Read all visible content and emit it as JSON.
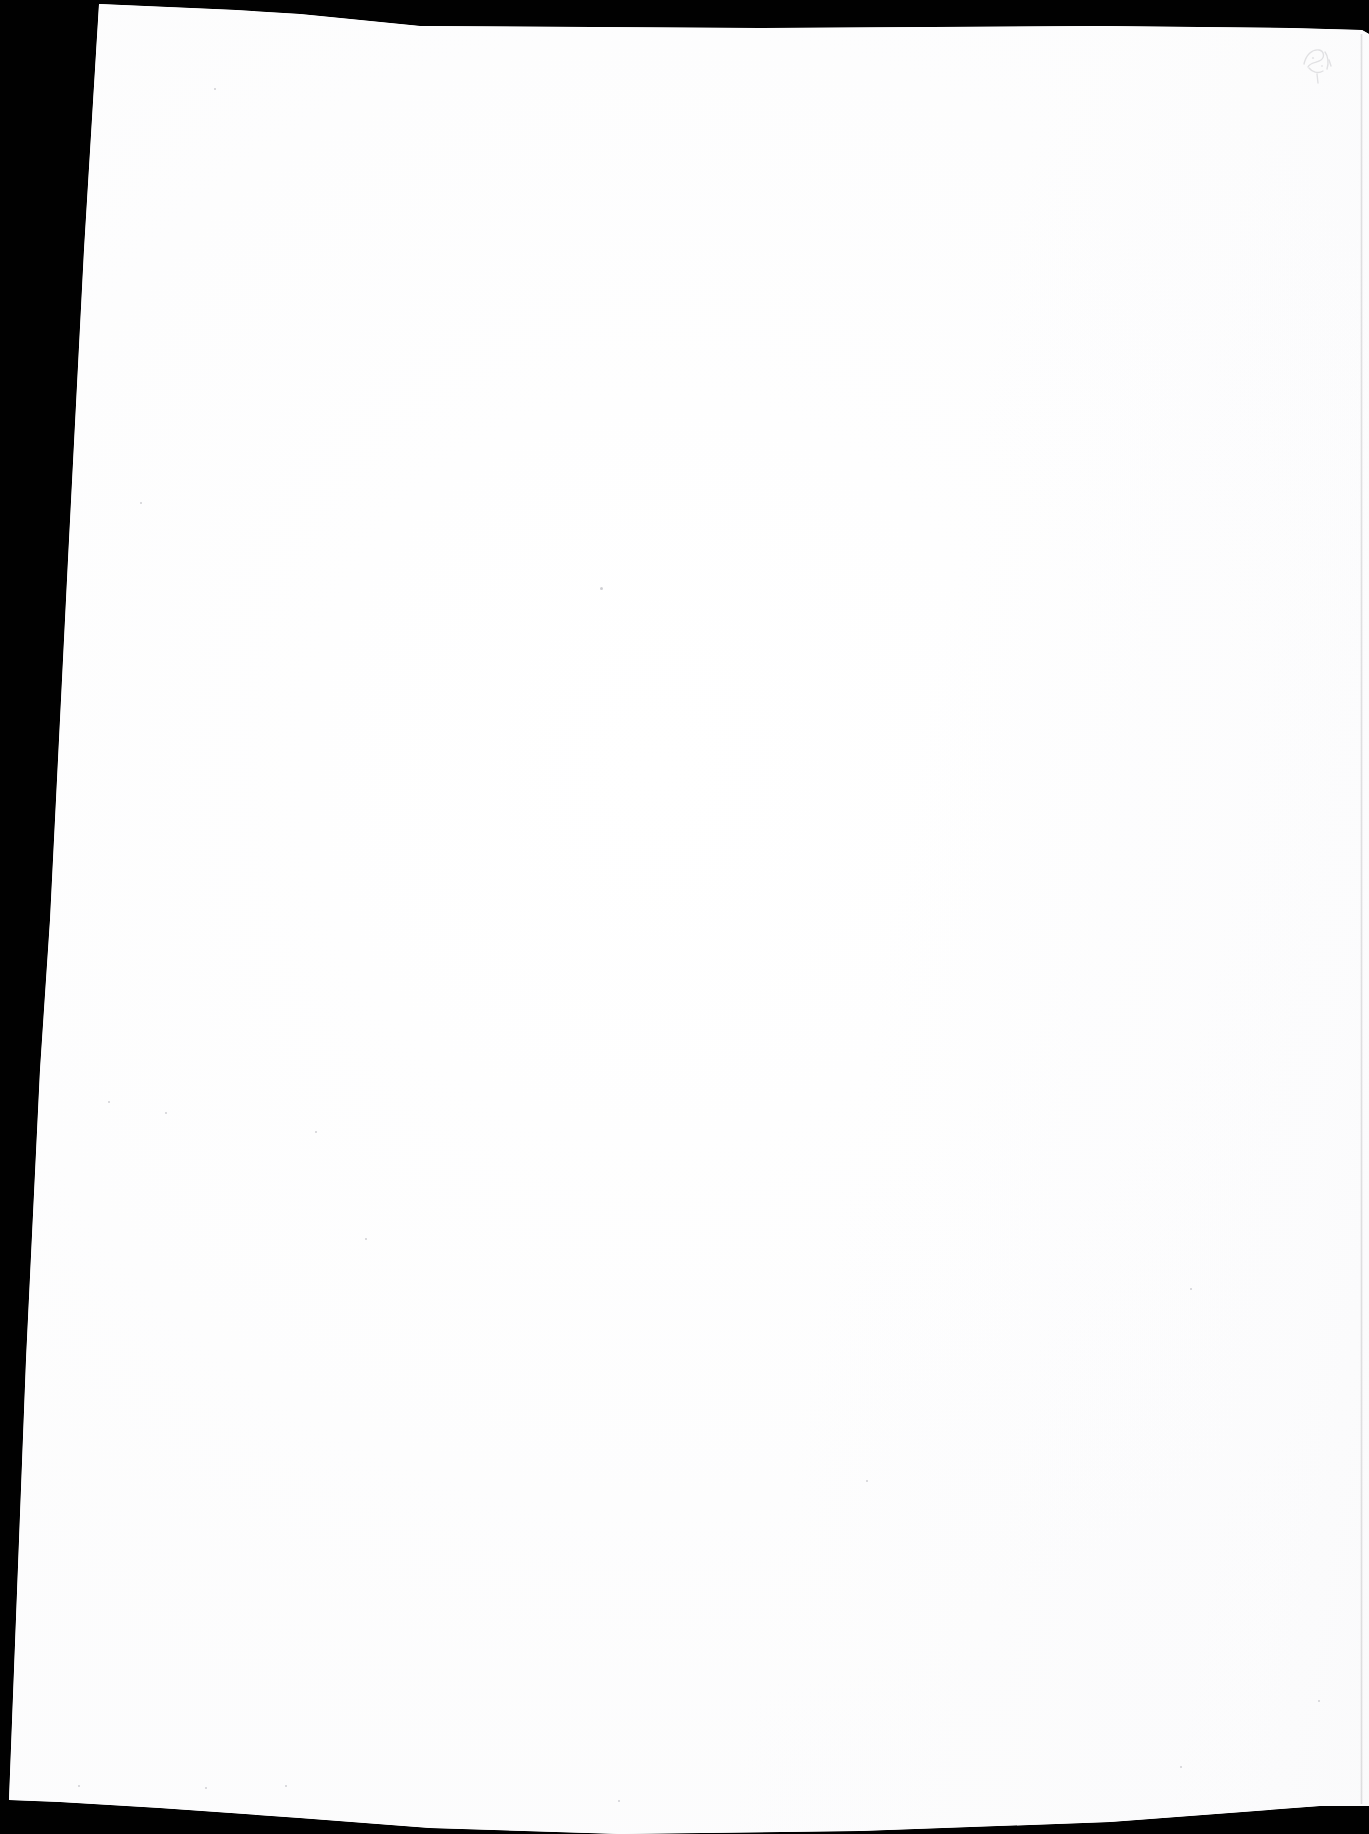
{
  "document": {
    "kind": "scanned-page",
    "page_content": "",
    "page_state_label": "Blank page",
    "orientation": "portrait"
  },
  "canvas": {
    "width": 1369,
    "height": 1834
  },
  "colors": {
    "scanner_background": "#010101",
    "paper": "#ffffff",
    "paper_shade": "#fbfbfc",
    "edge_shadow": "#78787d",
    "speck": "#cfcfd3",
    "ghost_mark": "#b9b9be"
  },
  "paper": {
    "corners": {
      "top_left": [
        99,
        4
      ],
      "top_right": [
        1369,
        34
      ],
      "bottom_right": [
        1369,
        1806
      ],
      "bottom_left": [
        9,
        1800
      ]
    },
    "skew_note": "left edge slopes inward from x=99 at top to x=9 at bottom"
  },
  "marks": {
    "ghost_mark": {
      "name": "faint-pencil-ghost-mark",
      "x": 1297,
      "y": 38,
      "width": 46,
      "height": 50,
      "opacity": 0.4
    },
    "specks": [
      {
        "x": 214,
        "y": 88,
        "size": 2
      },
      {
        "x": 600,
        "y": 587,
        "size": 3
      },
      {
        "x": 140,
        "y": 502,
        "size": 2
      },
      {
        "x": 165,
        "y": 1112,
        "size": 2
      },
      {
        "x": 108,
        "y": 1101,
        "size": 2
      },
      {
        "x": 315,
        "y": 1131,
        "size": 2
      },
      {
        "x": 365,
        "y": 1238,
        "size": 2
      },
      {
        "x": 78,
        "y": 1785,
        "size": 2
      },
      {
        "x": 205,
        "y": 1787,
        "size": 2
      },
      {
        "x": 285,
        "y": 1785,
        "size": 2
      },
      {
        "x": 618,
        "y": 1800,
        "size": 2
      },
      {
        "x": 1180,
        "y": 1766,
        "size": 2
      },
      {
        "x": 1318,
        "y": 1700,
        "size": 2
      },
      {
        "x": 1190,
        "y": 1288,
        "size": 2
      },
      {
        "x": 866,
        "y": 1480,
        "size": 2
      }
    ]
  }
}
